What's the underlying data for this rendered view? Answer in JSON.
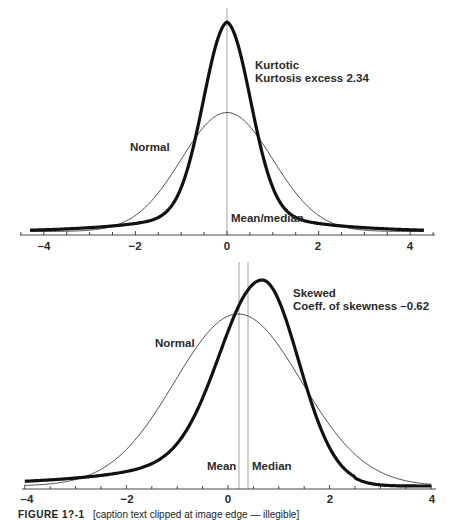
{
  "chart_data": [
    {
      "type": "line",
      "title": "",
      "xlabel": "",
      "ylabel": "",
      "xlim": [
        -4.4,
        4.4
      ],
      "x_ticks": [
        -4,
        -2,
        0,
        2,
        4
      ],
      "x_tick_labels": [
        "–4",
        "−2",
        "0",
        "2",
        "4"
      ],
      "minor_ticks_step": 0.5,
      "y_axis_shown": false,
      "grid": false,
      "legend": "none (inline labels)",
      "series": [
        {
          "name": "Normal",
          "style": "thin",
          "description": "standard normal density, mean 0, sd 1",
          "x": [
            -4.3,
            -3,
            -2,
            -1.5,
            -1,
            -0.5,
            0,
            0.5,
            1,
            1.5,
            2,
            3,
            4.3
          ],
          "relative_height": [
            0.0,
            0.03,
            0.14,
            0.33,
            0.61,
            0.88,
            1.0,
            0.88,
            0.61,
            0.33,
            0.14,
            0.03,
            0.0
          ]
        },
        {
          "name": "Kurtotic",
          "style": "thick",
          "kurtosis_excess": 2.34,
          "x": [
            -4.3,
            -3,
            -2,
            -1.5,
            -1,
            -0.5,
            0,
            0.5,
            1,
            1.5,
            2,
            3,
            4.3
          ],
          "relative_height_vs_normal_peak": [
            0.02,
            0.09,
            0.18,
            0.26,
            0.55,
            1.35,
            1.78,
            1.35,
            0.55,
            0.26,
            0.18,
            0.09,
            0.02
          ]
        }
      ],
      "annotations": [
        {
          "text": "Kurtotic",
          "line": 1
        },
        {
          "text": "Kurtosis excess 2.34",
          "line": 2
        },
        {
          "text": "Normal"
        },
        {
          "text": "Mean/median",
          "x": 0,
          "vertical_line": true
        }
      ]
    },
    {
      "type": "line",
      "title": "",
      "xlabel": "",
      "ylabel": "",
      "xlim": [
        -4,
        4
      ],
      "x_ticks": [
        -4,
        -2,
        0,
        2,
        4
      ],
      "x_tick_labels": [
        "–4",
        "−2",
        "0",
        "2",
        "4"
      ],
      "minor_ticks_step": 0.5,
      "y_axis_shown": false,
      "grid": false,
      "legend": "none (inline labels)",
      "series": [
        {
          "name": "Normal",
          "style": "thin",
          "description": "normal density matching mean/variance of skewed curve",
          "mean": 0.2,
          "x": [
            -4,
            -3,
            -2,
            -1,
            0,
            0.2,
            1,
            2,
            3,
            4
          ],
          "relative_height": [
            0.01,
            0.06,
            0.22,
            0.56,
            0.98,
            1.0,
            0.73,
            0.22,
            0.04,
            0.01
          ]
        },
        {
          "name": "Skewed",
          "style": "thick",
          "coefficient_of_skewness": -0.62,
          "peak_x": 0.67,
          "x": [
            -4,
            -3,
            -2,
            -1,
            0,
            0.67,
            1,
            1.8,
            2.5,
            3,
            4
          ],
          "relative_height_vs_normal_peak": [
            0.04,
            0.11,
            0.22,
            0.45,
            0.98,
            1.21,
            1.08,
            0.31,
            0.09,
            0.04,
            0.01
          ]
        }
      ],
      "annotations": [
        {
          "text": "Skewed",
          "line": 1
        },
        {
          "text": "Coeff. of skewness –0.62",
          "line": 2
        },
        {
          "text": "Normal"
        },
        {
          "text": "Mean",
          "x": 0.2,
          "vertical_line": true
        },
        {
          "text": "Median",
          "x": 0.38,
          "vertical_line": true
        }
      ]
    }
  ],
  "top": {
    "label_kurtotic": "Kurtotic",
    "label_kurtosis_excess": "Kurtosis excess 2.34",
    "label_normal": "Normal",
    "label_mean_median": "Mean/median",
    "ticks": [
      "–4",
      "−2",
      "0",
      "2",
      "4"
    ]
  },
  "bottom": {
    "label_skewed": "Skewed",
    "label_skewness": "Coeff. of skewness –0.62",
    "label_normal": "Normal",
    "label_mean": "Mean",
    "label_median": "Median",
    "ticks": [
      "–4",
      "−2",
      "0",
      "2",
      "4"
    ]
  },
  "caption": {
    "figure_label": "FIGURE 1?-1",
    "text": "[caption text clipped at image edge — illegible]",
    "legibility": "partial: only the top half of the glyphs is visible; the figure number and caption wording cannot be read reliably"
  }
}
